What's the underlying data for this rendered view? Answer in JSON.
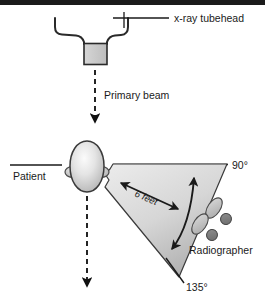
{
  "figure": {
    "top_border_color": "#1b1b1b",
    "line_color": "#1a1a1a",
    "labels": {
      "tubehead": "x-ray tubehead",
      "primary_beam": "Primary beam",
      "patient": "Patient",
      "distance": "6 feet",
      "angle_90": "90°",
      "angle_135": "135°",
      "radiographer": "Radiographer"
    },
    "parts": {
      "tubehead_yoke": "tubehead-yoke",
      "collimator": "collimator-box",
      "beam_arrow": "primary-beam-arrow",
      "patient_head": "patient-head",
      "scatter_wedge": "scatter-wedge",
      "distance_arrow": "six-feet-arrow",
      "position_arrow": "radiographer-position-arrow",
      "foot_left": "footprint-left",
      "foot_right": "footprint-right",
      "transmitted_arrow": "transmitted-beam-arrow",
      "patient_leader": "patient-leader-line",
      "tubehead_leader": "tubehead-leader-line",
      "baseline_90": "ninety-degree-baseline",
      "leader_135": "one-thirty-five-leader"
    },
    "colors": {
      "collimator_fill": "#c9c9c9",
      "head_fill_center": "#f2f2f2",
      "head_fill_edge": "#b8b8b8",
      "wedge_fill_light": "#e6e6e6",
      "wedge_fill_dark": "#b9b9b9",
      "foot_sole": "#c0c0c0",
      "foot_heel": "#7d7d7d"
    }
  }
}
